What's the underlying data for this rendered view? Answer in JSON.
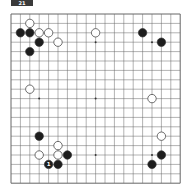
{
  "diagram": {
    "label": "21",
    "board_size": 19,
    "origin": {
      "x": 11,
      "y": 14
    },
    "spacing": 9.4,
    "star_points": [
      [
        3,
        3
      ],
      [
        9,
        3
      ],
      [
        15,
        3
      ],
      [
        3,
        9
      ],
      [
        9,
        9
      ],
      [
        15,
        9
      ],
      [
        3,
        15
      ],
      [
        9,
        15
      ],
      [
        15,
        15
      ]
    ],
    "stones": [
      {
        "color": "white",
        "col": 2,
        "row": 1
      },
      {
        "color": "black",
        "col": 1,
        "row": 2
      },
      {
        "color": "black",
        "col": 2,
        "row": 2
      },
      {
        "color": "white",
        "col": 3,
        "row": 2
      },
      {
        "color": "white",
        "col": 4,
        "row": 2
      },
      {
        "color": "black",
        "col": 3,
        "row": 3
      },
      {
        "color": "white",
        "col": 5,
        "row": 3
      },
      {
        "color": "black",
        "col": 2,
        "row": 4
      },
      {
        "color": "white",
        "col": 9,
        "row": 2
      },
      {
        "color": "black",
        "col": 14,
        "row": 2
      },
      {
        "color": "black",
        "col": 16,
        "row": 3
      },
      {
        "color": "white",
        "col": 2,
        "row": 8
      },
      {
        "color": "white",
        "col": 15,
        "row": 9
      },
      {
        "color": "black",
        "col": 3,
        "row": 13
      },
      {
        "color": "white",
        "col": 16,
        "row": 13
      },
      {
        "color": "white",
        "col": 5,
        "row": 14
      },
      {
        "color": "white",
        "col": 3,
        "row": 15
      },
      {
        "color": "white",
        "col": 5,
        "row": 15
      },
      {
        "color": "black",
        "col": 6,
        "row": 15
      },
      {
        "color": "black",
        "col": 4,
        "row": 16,
        "label": "1"
      },
      {
        "color": "black",
        "col": 5,
        "row": 16
      },
      {
        "color": "black",
        "col": 16,
        "row": 15
      },
      {
        "color": "black",
        "col": 15,
        "row": 16
      }
    ]
  }
}
